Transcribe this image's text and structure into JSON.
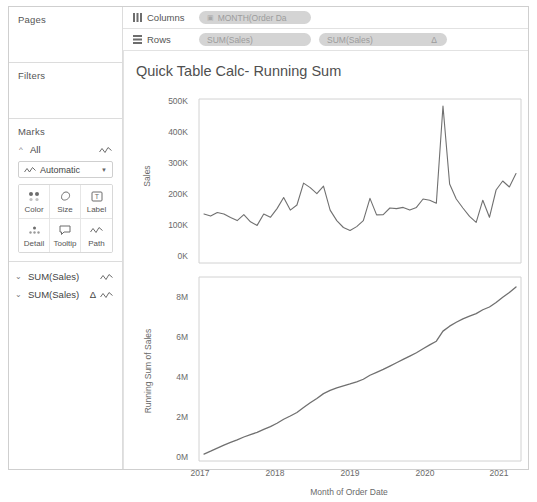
{
  "sidebar": {
    "pages": {
      "title": "Pages"
    },
    "filters": {
      "title": "Filters"
    },
    "marks": {
      "title": "Marks",
      "all_label": "All",
      "all_icon": "line-mark-icon",
      "type_label": "Automatic",
      "type_icon": "line-mark-icon",
      "caret_icon": "chevron-down-icon",
      "buttons": [
        {
          "label": "Color",
          "icon": "color-icon"
        },
        {
          "label": "Size",
          "icon": "size-icon"
        },
        {
          "label": "Label",
          "icon": "label-icon"
        },
        {
          "label": "Detail",
          "icon": "detail-icon"
        },
        {
          "label": "Tooltip",
          "icon": "tooltip-icon"
        },
        {
          "label": "Path",
          "icon": "path-icon"
        }
      ]
    },
    "measure_cards": [
      {
        "label": "SUM(Sales)",
        "delta": "",
        "chevron": "chevron-down-icon",
        "mark_icon": "line-mark-icon"
      },
      {
        "label": "SUM(Sales)",
        "delta": "Δ",
        "chevron": "chevron-down-icon",
        "mark_icon": "line-mark-icon"
      }
    ]
  },
  "shelves": {
    "columns": {
      "label": "Columns",
      "icon": "columns-icon",
      "pills": [
        {
          "text": "MONTH(Order Da",
          "icon": "calendar-icon"
        }
      ]
    },
    "rows": {
      "label": "Rows",
      "icon": "rows-icon",
      "pills": [
        {
          "text": "SUM(Sales)",
          "badge": ""
        },
        {
          "text": "SUM(Sales)",
          "badge": "Δ"
        }
      ]
    }
  },
  "viz": {
    "title": "Quick Table Calc- Running Sum"
  },
  "colors": {
    "line": "#707070",
    "pill": "#d4d4d4",
    "pill_text": "#9c9c9c",
    "axis": "#d2d2d2",
    "border": "#cfcfcf",
    "text": "#4a4a4a"
  },
  "chart_data": [
    {
      "type": "line",
      "title": "Sales",
      "xlabel": "",
      "ylabel": "Sales",
      "ylim": [
        0,
        520000
      ],
      "yticks": [
        "0K",
        "100K",
        "200K",
        "300K",
        "400K",
        "500K"
      ],
      "ytick_values": [
        0,
        100000,
        200000,
        300000,
        400000,
        500000
      ],
      "xticks": [
        "2017",
        "2018",
        "2019",
        "2020",
        "2021"
      ],
      "xtick_values": [
        2017,
        2018,
        2019,
        2020,
        2021
      ],
      "grid": false,
      "x": [
        "2017-01",
        "2017-02",
        "2017-03",
        "2017-04",
        "2017-05",
        "2017-06",
        "2017-07",
        "2017-08",
        "2017-09",
        "2017-10",
        "2017-11",
        "2017-12",
        "2018-01",
        "2018-02",
        "2018-03",
        "2018-04",
        "2018-05",
        "2018-06",
        "2018-07",
        "2018-08",
        "2018-09",
        "2018-10",
        "2018-11",
        "2018-12",
        "2019-01",
        "2019-02",
        "2019-03",
        "2019-04",
        "2019-05",
        "2019-06",
        "2019-07",
        "2019-08",
        "2019-09",
        "2019-10",
        "2019-11",
        "2019-12",
        "2020-01",
        "2020-02",
        "2020-03",
        "2020-04",
        "2020-05",
        "2020-06",
        "2020-07",
        "2020-08",
        "2020-09",
        "2020-10",
        "2020-11",
        "2020-12"
      ],
      "values": [
        150000,
        143000,
        155000,
        150000,
        138000,
        128000,
        148000,
        124000,
        112000,
        150000,
        139000,
        168000,
        205000,
        163000,
        180000,
        253000,
        238000,
        218000,
        243000,
        163000,
        128000,
        105000,
        95000,
        108000,
        128000,
        202000,
        147000,
        148000,
        170000,
        168000,
        172000,
        163000,
        172000,
        200000,
        196000,
        186000,
        510000,
        250000,
        200000,
        170000,
        142000,
        122000,
        196000,
        139000,
        230000,
        260000,
        240000,
        285000
      ],
      "series_note": "single series line, monthly sales"
    },
    {
      "type": "line",
      "title": "Running Sum of Sales",
      "xlabel": "Month of Order Date",
      "ylabel": "Running Sum of Sales",
      "ylim": [
        0,
        8800000
      ],
      "yticks": [
        "0M",
        "2M",
        "4M",
        "6M",
        "8M"
      ],
      "ytick_values": [
        0,
        2000000,
        4000000,
        6000000,
        8000000
      ],
      "xticks": [
        "2017",
        "2018",
        "2019",
        "2020",
        "2021"
      ],
      "xtick_values": [
        2017,
        2018,
        2019,
        2020,
        2021
      ],
      "grid": false,
      "x": [
        "2017-01",
        "2017-02",
        "2017-03",
        "2017-04",
        "2017-05",
        "2017-06",
        "2017-07",
        "2017-08",
        "2017-09",
        "2017-10",
        "2017-11",
        "2017-12",
        "2018-01",
        "2018-02",
        "2018-03",
        "2018-04",
        "2018-05",
        "2018-06",
        "2018-07",
        "2018-08",
        "2018-09",
        "2018-10",
        "2018-11",
        "2018-12",
        "2019-01",
        "2019-02",
        "2019-03",
        "2019-04",
        "2019-05",
        "2019-06",
        "2019-07",
        "2019-08",
        "2019-09",
        "2019-10",
        "2019-11",
        "2019-12",
        "2020-01",
        "2020-02",
        "2020-03",
        "2020-04",
        "2020-05",
        "2020-06",
        "2020-07",
        "2020-08",
        "2020-09",
        "2020-10",
        "2020-11",
        "2020-12"
      ],
      "values": [
        150000,
        293000,
        448000,
        598000,
        736000,
        864000,
        1012000,
        1136000,
        1248000,
        1398000,
        1537000,
        1705000,
        1910000,
        2073000,
        2253000,
        2506000,
        2744000,
        2962000,
        3205000,
        3368000,
        3496000,
        3601000,
        3696000,
        3804000,
        3932000,
        4134000,
        4281000,
        4429000,
        4599000,
        4767000,
        4939000,
        5102000,
        5274000,
        5474000,
        5670000,
        5856000,
        6366000,
        6616000,
        6816000,
        6986000,
        7128000,
        7250000,
        7446000,
        7585000,
        7815000,
        8075000,
        8315000,
        8600000
      ],
      "series_note": "cumulative running sum of monthly sales"
    }
  ]
}
